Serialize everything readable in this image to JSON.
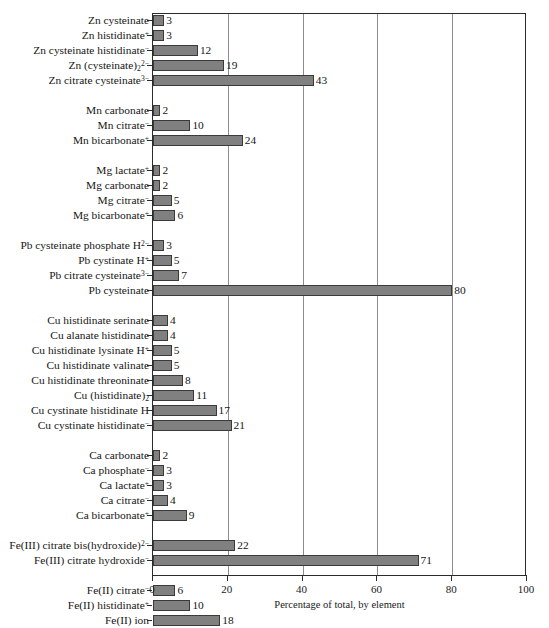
{
  "chart_data": {
    "type": "bar",
    "orientation": "horizontal",
    "title": "",
    "xlabel": "Percentage of total, by element",
    "ylabel": "",
    "xlim": [
      0,
      100
    ],
    "xticks": [
      0,
      20,
      40,
      60,
      80,
      100
    ],
    "grid": "vertical gridlines at 20, 40, 60, 80",
    "legend": "none",
    "bar_color": "#808080",
    "bar_edge_color": "#3a3a3a",
    "value_labels": true,
    "groups": [
      {
        "element": "Zn",
        "items": [
          {
            "label_html": "Zn cysteinate",
            "value": 3
          },
          {
            "label_html": "Zn histidinate<sup>+</sup>",
            "value": 3
          },
          {
            "label_html": "Zn cysteinate histidinate<sup>&minus;</sup>",
            "value": 12
          },
          {
            "label_html": "Zn (cysteinate)<sub>2</sub><sup>2&minus;</sup>",
            "value": 19
          },
          {
            "label_html": "Zn citrate cysteinate<sup>3&minus;</sup>",
            "value": 43
          }
        ]
      },
      {
        "element": "Mn",
        "items": [
          {
            "label_html": "Mn carbonate",
            "value": 2
          },
          {
            "label_html": "Mn citrate<sup>&minus;</sup>",
            "value": 10
          },
          {
            "label_html": "Mn bicarbonate<sup>+</sup>",
            "value": 24
          }
        ]
      },
      {
        "element": "Mg",
        "items": [
          {
            "label_html": "Mg lactate<sup>+</sup>",
            "value": 2
          },
          {
            "label_html": "Mg carbonate",
            "value": 2
          },
          {
            "label_html": "Mg citrate<sup>&minus;</sup>",
            "value": 5
          },
          {
            "label_html": "Mg bicarbonate<sup>+</sup>",
            "value": 6
          }
        ]
      },
      {
        "element": "Pb",
        "items": [
          {
            "label_html": "Pb cysteinate phosphate H<sup>2&minus;</sup>",
            "value": 3
          },
          {
            "label_html": "Pb cystinate H<sup>+</sup>",
            "value": 5
          },
          {
            "label_html": "Pb citrate cysteinate<sup>3&minus;</sup>",
            "value": 7
          },
          {
            "label_html": "Pb cysteinate",
            "value": 80
          }
        ]
      },
      {
        "element": "Cu",
        "items": [
          {
            "label_html": "Cu histidinate serinate",
            "value": 4
          },
          {
            "label_html": "Cu alanate histidinate",
            "value": 4
          },
          {
            "label_html": "Cu histidinate lysinate H<sup>+</sup>",
            "value": 5
          },
          {
            "label_html": "Cu histidinate valinate",
            "value": 5
          },
          {
            "label_html": "Cu histidinate threoninate",
            "value": 8
          },
          {
            "label_html": "Cu (histidinate)<sub>2</sub>",
            "value": 11
          },
          {
            "label_html": "Cu cystinate histidinate H",
            "value": 17
          },
          {
            "label_html": "Cu cystinate histidinate<sup>&minus;</sup>",
            "value": 21
          }
        ]
      },
      {
        "element": "Ca",
        "items": [
          {
            "label_html": "Ca carbonate",
            "value": 2
          },
          {
            "label_html": "Ca phosphate<sup>&minus;</sup>",
            "value": 3
          },
          {
            "label_html": "Ca lactate<sup>+</sup>",
            "value": 3
          },
          {
            "label_html": "Ca citrate<sup>&minus;</sup>",
            "value": 4
          },
          {
            "label_html": "Ca bicarbonate<sup>+</sup>",
            "value": 9
          }
        ]
      },
      {
        "element": "Fe(III)",
        "items": [
          {
            "label_html": "Fe(III) citrate bis(hydroxide)<sup>2&minus;</sup>",
            "value": 22
          },
          {
            "label_html": "Fe(III) citrate hydroxide<sup>&minus;</sup>",
            "value": 71
          }
        ]
      },
      {
        "element": "Fe(II)",
        "items": [
          {
            "label_html": "Fe(II) citrate<sup>&minus;</sup>",
            "value": 6
          },
          {
            "label_html": "Fe(II) histidinate<sup>+</sup>",
            "value": 10
          },
          {
            "label_html": "Fe(II) ion",
            "value": 18
          },
          {
            "label_html": "Fe(II) bicarbonate<sup>+</sup>",
            "value": 18
          },
          {
            "label_html": "Fe(II) carbonate",
            "value": 18
          }
        ]
      }
    ]
  }
}
